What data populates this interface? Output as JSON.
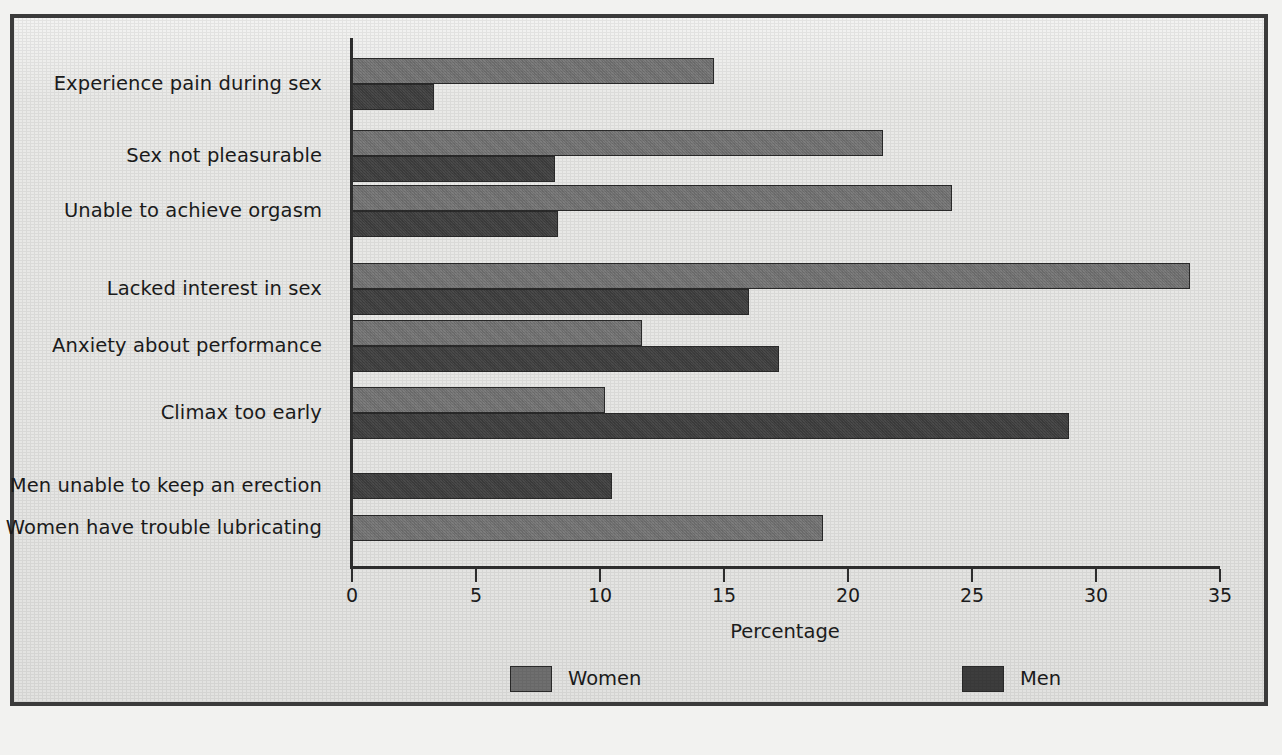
{
  "chart_data": {
    "type": "bar",
    "orientation": "horizontal",
    "title": "",
    "xlabel": "Percentage",
    "ylabel": "",
    "xlim": [
      0,
      35
    ],
    "xticks": [
      0,
      5,
      10,
      15,
      20,
      25,
      30,
      35
    ],
    "xtick_labels": [
      "0",
      "5",
      "10",
      "15",
      "20",
      "25",
      "30",
      "35"
    ],
    "grid": false,
    "legend_position": "bottom",
    "categories": [
      "Experience pain during sex",
      "Sex not pleasurable",
      "Unable to achieve orgasm",
      "Lacked interest in sex",
      "Anxiety about performance",
      "Climax too early",
      "Men unable to keep an erection",
      "Women have trouble lubricating"
    ],
    "series": [
      {
        "name": "Women",
        "color": "#6f6f6f",
        "values": [
          14.6,
          21.4,
          24.2,
          33.8,
          11.7,
          10.2,
          null,
          19.0
        ]
      },
      {
        "name": "Men",
        "color": "#3d3d3d",
        "values": [
          3.3,
          8.2,
          8.3,
          16.0,
          17.2,
          28.9,
          10.5,
          null
        ]
      }
    ]
  },
  "legend": {
    "items": [
      {
        "label": "Women",
        "color": "#6f6f6f"
      },
      {
        "label": "Men",
        "color": "#3d3d3d"
      }
    ]
  },
  "axis": {
    "x_title": "Percentage"
  },
  "colors": {
    "frame_border": "#3b3b3b",
    "plot_background": "#e9e9e7",
    "axis_line": "#2e2e2e",
    "text": "#1c1c1c",
    "women_bar": "#6f6f6f",
    "men_bar": "#3d3d3d"
  }
}
